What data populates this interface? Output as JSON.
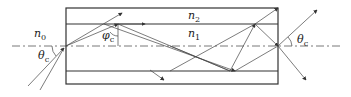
{
  "diagram": {
    "labels": {
      "n0": {
        "base": "n",
        "sub": "0"
      },
      "n1": {
        "base": "n",
        "sub": "1"
      },
      "n2": {
        "base": "n",
        "sub": "2"
      },
      "theta_in": {
        "base": "θ",
        "sub": "c"
      },
      "phi": {
        "base": "φ",
        "sub": "c"
      },
      "theta_out": {
        "base": "θ",
        "sub": "c"
      }
    },
    "colors": {
      "line": "#333333",
      "background": "#ffffff"
    }
  }
}
